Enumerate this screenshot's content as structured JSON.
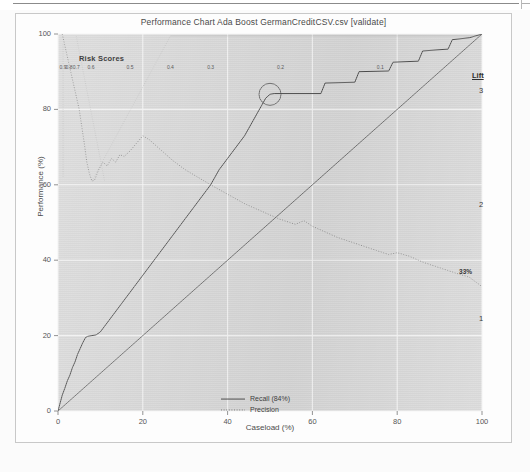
{
  "window": {
    "chrome": "thin-title-bar"
  },
  "chart_data": {
    "type": "line",
    "title": "Performance Chart Ada Boost GermanCreditCSV.csv [validate]",
    "xlabel": "Caseload (%)",
    "ylabel": "Performance (%)",
    "xlim": [
      0,
      100
    ],
    "ylim": [
      0,
      100
    ],
    "grid": true,
    "xticks": [
      0,
      20,
      40,
      60,
      80,
      100
    ],
    "yticks": [
      0,
      20,
      40,
      60,
      80,
      100
    ],
    "legend_position": "bottom-center",
    "legend": [
      {
        "label": "Recall (84%)",
        "style": "solid"
      },
      {
        "label": "Precision",
        "style": "dotted"
      }
    ],
    "top_axis": {
      "label": "Risk Scores",
      "ticks": [
        "0.9",
        "0.8",
        "0.7",
        "0.6",
        "0.5",
        "0.4",
        "0.3",
        "0.2",
        "0.1"
      ],
      "tick_positions": [
        1.2,
        2.6,
        4.3,
        7.8,
        17.0,
        26.5,
        36.0,
        52.5,
        76.0
      ]
    },
    "right_axis": {
      "label": "Lift",
      "ticks": [
        "3",
        "2",
        "1"
      ],
      "tick_values": [
        3,
        2,
        1
      ]
    },
    "annotations": [
      {
        "text": "33%",
        "x": 96,
        "y": 37,
        "kind": "precision-endpoint-label"
      },
      {
        "text": "",
        "x": 50,
        "y": 84,
        "kind": "circle-highlight-recall"
      }
    ],
    "series": [
      {
        "name": "Recall (84%)",
        "style": "solid",
        "points": [
          [
            0,
            0
          ],
          [
            1.0,
            4.2
          ],
          [
            1.6,
            6.0
          ],
          [
            2.2,
            8.0
          ],
          [
            2.8,
            9.5
          ],
          [
            3.4,
            11.5
          ],
          [
            4.0,
            13.0
          ],
          [
            4.6,
            15.0
          ],
          [
            5.2,
            16.5
          ],
          [
            5.8,
            18.0
          ],
          [
            6.5,
            19.5
          ],
          [
            7.0,
            19.8
          ],
          [
            8.0,
            20.0
          ],
          [
            9.0,
            20.2
          ],
          [
            10.0,
            21.0
          ],
          [
            11.0,
            22.5
          ],
          [
            12.0,
            24.0
          ],
          [
            13.0,
            25.5
          ],
          [
            14.0,
            27.0
          ],
          [
            15.0,
            28.5
          ],
          [
            16.0,
            30.0
          ],
          [
            17.0,
            31.5
          ],
          [
            18.0,
            33.0
          ],
          [
            19.0,
            34.5
          ],
          [
            20.0,
            36.0
          ],
          [
            21.0,
            37.5
          ],
          [
            22.0,
            39.0
          ],
          [
            23.0,
            40.5
          ],
          [
            24.0,
            42.0
          ],
          [
            25.0,
            43.5
          ],
          [
            26.0,
            45.0
          ],
          [
            27.0,
            46.5
          ],
          [
            28.0,
            48.0
          ],
          [
            29.0,
            49.5
          ],
          [
            30.0,
            51.0
          ],
          [
            31.0,
            52.5
          ],
          [
            32.0,
            54.0
          ],
          [
            33.0,
            55.5
          ],
          [
            34.0,
            57.0
          ],
          [
            35.0,
            58.5
          ],
          [
            36.0,
            60.0
          ],
          [
            37.0,
            62.0
          ],
          [
            38.0,
            64.0
          ],
          [
            39.0,
            65.5
          ],
          [
            40.0,
            67.0
          ],
          [
            41.0,
            68.5
          ],
          [
            42.0,
            70.0
          ],
          [
            43.0,
            71.5
          ],
          [
            44.0,
            73.0
          ],
          [
            45.0,
            75.0
          ],
          [
            46.0,
            77.0
          ],
          [
            47.0,
            79.0
          ],
          [
            48.0,
            81.0
          ],
          [
            49.0,
            83.0
          ],
          [
            50.0,
            84.0
          ],
          [
            51.0,
            84.2
          ],
          [
            62.0,
            84.2
          ],
          [
            63.0,
            87.0
          ],
          [
            70.0,
            87.2
          ],
          [
            71.0,
            90.0
          ],
          [
            78.0,
            90.2
          ],
          [
            79.0,
            92.5
          ],
          [
            85.0,
            92.8
          ],
          [
            86.0,
            95.5
          ],
          [
            92.0,
            96.0
          ],
          [
            93.0,
            98.5
          ],
          [
            97.0,
            99.0
          ],
          [
            100.0,
            100.0
          ]
        ]
      },
      {
        "name": "Precision",
        "style": "dotted",
        "points": [
          [
            1.0,
            100.0
          ],
          [
            1.6,
            97.0
          ],
          [
            2.2,
            94.0
          ],
          [
            2.6,
            92.0
          ],
          [
            3.0,
            90.0
          ],
          [
            3.4,
            88.0
          ],
          [
            3.8,
            86.0
          ],
          [
            4.2,
            84.0
          ],
          [
            4.6,
            82.0
          ],
          [
            5.0,
            80.0
          ],
          [
            5.4,
            77.0
          ],
          [
            5.8,
            74.0
          ],
          [
            6.2,
            71.0
          ],
          [
            6.8,
            66.0
          ],
          [
            7.4,
            63.0
          ],
          [
            8.0,
            61.0
          ],
          [
            8.6,
            61.2
          ],
          [
            9.6,
            64.0
          ],
          [
            10.6,
            66.0
          ],
          [
            11.6,
            65.0
          ],
          [
            12.6,
            67.0
          ],
          [
            13.6,
            66.0
          ],
          [
            14.6,
            68.0
          ],
          [
            15.6,
            67.5
          ],
          [
            17.0,
            69.0
          ],
          [
            18.5,
            71.0
          ],
          [
            20.0,
            73.0
          ],
          [
            21.5,
            72.0
          ],
          [
            23.0,
            70.5
          ],
          [
            25.0,
            68.5
          ],
          [
            27.0,
            66.5
          ],
          [
            30.0,
            64.0
          ],
          [
            33.0,
            62.0
          ],
          [
            36.0,
            60.0
          ],
          [
            40.0,
            57.5
          ],
          [
            44.0,
            55.0
          ],
          [
            48.0,
            53.0
          ],
          [
            52.0,
            51.0
          ],
          [
            56.0,
            49.5
          ],
          [
            58.0,
            50.5
          ],
          [
            60.0,
            49.0
          ],
          [
            63.0,
            47.5
          ],
          [
            66.0,
            46.0
          ],
          [
            70.0,
            44.5
          ],
          [
            74.0,
            43.0
          ],
          [
            78.0,
            41.5
          ],
          [
            80.0,
            42.0
          ],
          [
            83.0,
            41.0
          ],
          [
            86.0,
            39.5
          ],
          [
            90.0,
            38.0
          ],
          [
            94.0,
            36.5
          ],
          [
            97.0,
            35.5
          ],
          [
            100.0,
            33.0
          ]
        ]
      },
      {
        "name": "Baseline",
        "style": "solid-diagonal",
        "points": [
          [
            0,
            0
          ],
          [
            100,
            100
          ]
        ]
      }
    ]
  },
  "colors": {
    "plot_background": "#d6d6d6",
    "recall_line": "#3a3a3a",
    "precision_line": "#6e6e6e",
    "grid": "#f2f2f2",
    "text": "#4a4a4a"
  }
}
